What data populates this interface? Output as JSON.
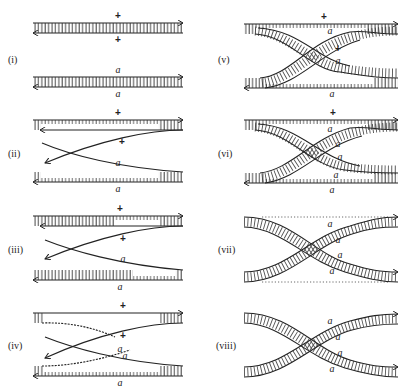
{
  "figure": {
    "panels": [
      {
        "id": "i",
        "label": "(i)",
        "top_markers": [
          "+",
          "+"
        ],
        "bottom_markers": [
          "a",
          "a"
        ]
      },
      {
        "id": "ii",
        "label": "(ii)",
        "top_markers": [
          "+",
          "+"
        ],
        "bottom_markers": [
          "a",
          "a"
        ]
      },
      {
        "id": "iii",
        "label": "(iii)",
        "top_markers": [
          "+",
          "+"
        ],
        "bottom_markers": [
          "a",
          "a",
          "a"
        ]
      },
      {
        "id": "iv",
        "label": "(iv)",
        "top_markers": [
          "+",
          "+"
        ],
        "bottom_markers": [
          "a",
          "a",
          "a"
        ]
      },
      {
        "id": "v",
        "label": "(v)",
        "top_markers": [
          "+",
          "a",
          "+"
        ],
        "bottom_markers": [
          "a",
          "a"
        ]
      },
      {
        "id": "vi",
        "label": "(vi)",
        "top_markers": [
          "+",
          "a",
          "a"
        ],
        "bottom_markers": [
          "a",
          "a",
          "a"
        ]
      },
      {
        "id": "vii",
        "label": "(vii)",
        "top_markers": [
          "a",
          "a"
        ],
        "bottom_markers": [
          "a",
          "a"
        ]
      },
      {
        "id": "viii",
        "label": "(viii)",
        "top_markers": [
          "a",
          "a"
        ],
        "bottom_markers": [
          "a",
          "a"
        ]
      }
    ]
  },
  "labels": {
    "i": "(i)",
    "ii": "(ii)",
    "iii": "(iii)",
    "iv": "(iv)",
    "v": "(v)",
    "vi": "(vi)",
    "vii": "(vii)",
    "viii": "(viii)"
  },
  "markers": {
    "plus": "+",
    "a": "a"
  },
  "colors": {
    "ink": "#222222",
    "background": "#ffffff"
  }
}
